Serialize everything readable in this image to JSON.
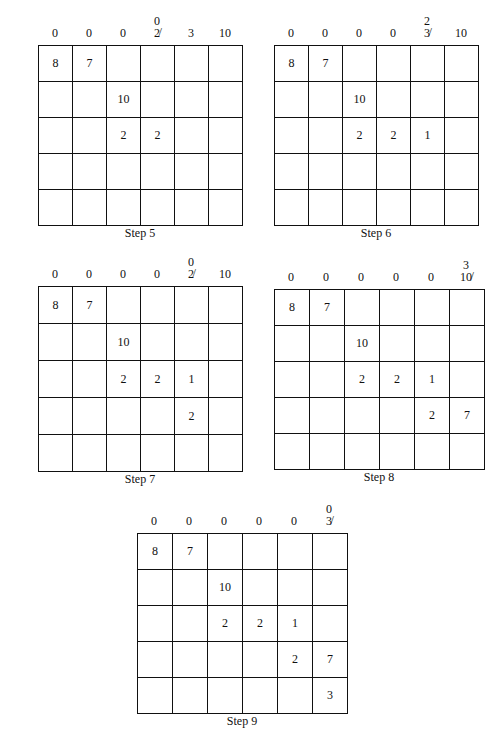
{
  "panels": [
    {
      "caption": "Step 5",
      "col_labels": [
        {
          "value": "0",
          "above": ""
        },
        {
          "value": "0",
          "above": ""
        },
        {
          "value": "0",
          "above": ""
        },
        {
          "value": "2̸",
          "above": "0"
        },
        {
          "value": "3",
          "above": ""
        },
        {
          "value": "10",
          "above": ""
        }
      ],
      "row_labels": [
        {
          "prefix": "",
          "value": "0"
        },
        {
          "prefix": "",
          "value": "0"
        },
        {
          "prefix": "1",
          "value": "3̸"
        },
        {
          "prefix": "",
          "value": "9"
        },
        {
          "prefix": "",
          "value": "3"
        }
      ],
      "cells": [
        [
          "8",
          "7",
          "",
          "",
          "",
          ""
        ],
        [
          "",
          "",
          "10",
          "",
          "",
          ""
        ],
        [
          "",
          "",
          "2",
          "2",
          "",
          ""
        ],
        [
          "",
          "",
          "",
          "",
          "",
          ""
        ],
        [
          "",
          "",
          "",
          "",
          "",
          ""
        ]
      ]
    },
    {
      "caption": "Step 6",
      "col_labels": [
        {
          "value": "0",
          "above": ""
        },
        {
          "value": "0",
          "above": ""
        },
        {
          "value": "0",
          "above": ""
        },
        {
          "value": "0",
          "above": ""
        },
        {
          "value": "3̸",
          "above": "2"
        },
        {
          "value": "10",
          "above": ""
        }
      ],
      "row_labels": [
        {
          "prefix": "",
          "value": "0"
        },
        {
          "prefix": "",
          "value": "0"
        },
        {
          "prefix": "0",
          "value": "1̸"
        },
        {
          "prefix": "",
          "value": "9"
        },
        {
          "prefix": "",
          "value": "3"
        }
      ],
      "cells": [
        [
          "8",
          "7",
          "",
          "",
          "",
          ""
        ],
        [
          "",
          "",
          "10",
          "",
          "",
          ""
        ],
        [
          "",
          "",
          "2",
          "2",
          "1",
          ""
        ],
        [
          "",
          "",
          "",
          "",
          "",
          ""
        ],
        [
          "",
          "",
          "",
          "",
          "",
          ""
        ]
      ]
    },
    {
      "caption": "Step 7",
      "col_labels": [
        {
          "value": "0",
          "above": ""
        },
        {
          "value": "0",
          "above": ""
        },
        {
          "value": "0",
          "above": ""
        },
        {
          "value": "0",
          "above": ""
        },
        {
          "value": "2̸",
          "above": "0"
        },
        {
          "value": "10",
          "above": ""
        }
      ],
      "row_labels": [
        {
          "prefix": "",
          "value": "0"
        },
        {
          "prefix": "",
          "value": "0"
        },
        {
          "prefix": "",
          "value": "0"
        },
        {
          "prefix": "7",
          "value": "9̸"
        },
        {
          "prefix": "",
          "value": "3"
        }
      ],
      "cells": [
        [
          "8",
          "7",
          "",
          "",
          "",
          ""
        ],
        [
          "",
          "",
          "10",
          "",
          "",
          ""
        ],
        [
          "",
          "",
          "2",
          "2",
          "1",
          ""
        ],
        [
          "",
          "",
          "",
          "",
          "2",
          ""
        ],
        [
          "",
          "",
          "",
          "",
          "",
          ""
        ]
      ]
    },
    {
      "caption": "Step 8",
      "col_labels": [
        {
          "value": "0",
          "above": ""
        },
        {
          "value": "0",
          "above": ""
        },
        {
          "value": "0",
          "above": ""
        },
        {
          "value": "0",
          "above": ""
        },
        {
          "value": "0",
          "above": ""
        },
        {
          "value": "10̸",
          "above": "3"
        }
      ],
      "row_labels": [
        {
          "prefix": "",
          "value": "0"
        },
        {
          "prefix": "",
          "value": "0"
        },
        {
          "prefix": "",
          "value": "0"
        },
        {
          "prefix": "0",
          "value": "7̸"
        },
        {
          "prefix": "",
          "value": "3"
        }
      ],
      "cells": [
        [
          "8",
          "7",
          "",
          "",
          "",
          ""
        ],
        [
          "",
          "",
          "10",
          "",
          "",
          ""
        ],
        [
          "",
          "",
          "2",
          "2",
          "1",
          ""
        ],
        [
          "",
          "",
          "",
          "",
          "2",
          "7"
        ],
        [
          "",
          "",
          "",
          "",
          "",
          ""
        ]
      ]
    },
    {
      "caption": "Step 9",
      "col_labels": [
        {
          "value": "0",
          "above": ""
        },
        {
          "value": "0",
          "above": ""
        },
        {
          "value": "0",
          "above": ""
        },
        {
          "value": "0",
          "above": ""
        },
        {
          "value": "0",
          "above": ""
        },
        {
          "value": "3̸",
          "above": "0"
        }
      ],
      "row_labels": [
        {
          "prefix": "",
          "value": "0"
        },
        {
          "prefix": "",
          "value": "0"
        },
        {
          "prefix": "",
          "value": "0"
        },
        {
          "prefix": "",
          "value": "0"
        },
        {
          "prefix": "0",
          "value": "3̸"
        }
      ],
      "cells": [
        [
          "8",
          "7",
          "",
          "",
          "",
          ""
        ],
        [
          "",
          "",
          "10",
          "",
          "",
          ""
        ],
        [
          "",
          "",
          "2",
          "2",
          "1",
          ""
        ],
        [
          "",
          "",
          "",
          "",
          "2",
          "7"
        ],
        [
          "",
          "",
          "",
          "",
          "",
          "3"
        ]
      ]
    }
  ]
}
